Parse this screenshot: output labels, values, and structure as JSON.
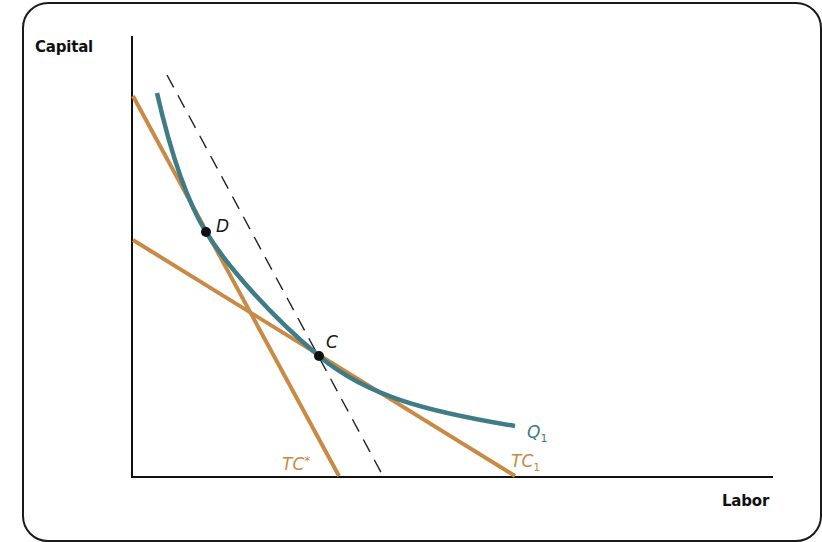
{
  "diagram": {
    "type": "isoquant-isocost",
    "axes": {
      "y_label": "Capital",
      "x_label": "Labor"
    },
    "curves": {
      "isoquant": {
        "label": "Q",
        "subscript": "1",
        "color": "#3f7c86"
      },
      "isocost_star": {
        "label": "TC",
        "superscript": "*",
        "color": "#c98a45"
      },
      "isocost_1": {
        "label": "TC",
        "subscript": "1",
        "color": "#c98a45"
      },
      "dashed_line": {
        "style": "dashed",
        "color": "#222222"
      }
    },
    "points": [
      {
        "label": "D",
        "color": "#111111"
      },
      {
        "label": "C",
        "color": "#111111"
      }
    ],
    "colors": {
      "axis": "#111111",
      "frame": "#1a1a1a",
      "background": "#ffffff"
    }
  }
}
